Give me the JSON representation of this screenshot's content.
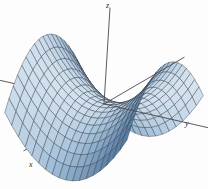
{
  "figure": {
    "title": "",
    "background_color": "#fdfdfd",
    "width": 208,
    "height": 189
  },
  "axes": {
    "z": {
      "label": "z",
      "name": "z-axis"
    },
    "y": {
      "label": "y",
      "name": "y-axis"
    },
    "x": {
      "label": "x",
      "name": "x-axis"
    },
    "line_color": "#4a4a4a"
  },
  "chart_data": {
    "type": "surface",
    "title": "",
    "xlabel": "x",
    "ylabel": "y",
    "zlabel": "z",
    "surface_name": "hyperbolic paraboloid (saddle)",
    "equation": "z = y^2 - x^2",
    "xlim": [
      -1,
      1
    ],
    "ylim": [
      -1,
      1
    ],
    "zlim": [
      -1,
      1
    ],
    "grid": true,
    "legend": false,
    "mesh": {
      "u_steps": 18,
      "v_steps": 18
    },
    "colormap": {
      "low": "#5b7fa6",
      "mid": "#9fbcd6",
      "high": "#e8f0f7",
      "edge": "#2f3b47"
    },
    "view": {
      "azimuth": -58,
      "elevation": 22
    },
    "samples": {
      "x": [
        -1,
        -0.75,
        -0.5,
        -0.25,
        0,
        0.25,
        0.5,
        0.75,
        1
      ],
      "y": [
        -1,
        -0.75,
        -0.5,
        -0.25,
        0,
        0.25,
        0.5,
        0.75,
        1
      ],
      "z": [
        [
          0,
          -0.4375,
          -0.75,
          -0.9375,
          -1,
          -0.9375,
          -0.75,
          -0.4375,
          0
        ],
        [
          0.4375,
          0,
          -0.3125,
          -0.5,
          -0.5625,
          -0.5,
          -0.3125,
          0,
          0.4375
        ],
        [
          0.75,
          0.3125,
          0,
          -0.1875,
          -0.25,
          -0.1875,
          0,
          0.3125,
          0.75
        ],
        [
          0.9375,
          0.5,
          0.1875,
          0,
          -0.0625,
          0,
          0.1875,
          0.5,
          0.9375
        ],
        [
          1,
          0.5625,
          0.25,
          0.0625,
          0,
          0.0625,
          0.25,
          0.5625,
          1
        ],
        [
          0.9375,
          0.5,
          0.1875,
          0,
          -0.0625,
          0,
          0.1875,
          0.5,
          0.9375
        ],
        [
          0.75,
          0.3125,
          0,
          -0.1875,
          -0.25,
          -0.1875,
          0,
          0.3125,
          0.75
        ],
        [
          0.4375,
          0,
          -0.3125,
          -0.5,
          -0.5625,
          -0.5,
          -0.3125,
          0,
          0.4375
        ],
        [
          0,
          -0.4375,
          -0.75,
          -0.9375,
          -1,
          -0.9375,
          -0.75,
          -0.4375,
          0
        ]
      ]
    }
  }
}
